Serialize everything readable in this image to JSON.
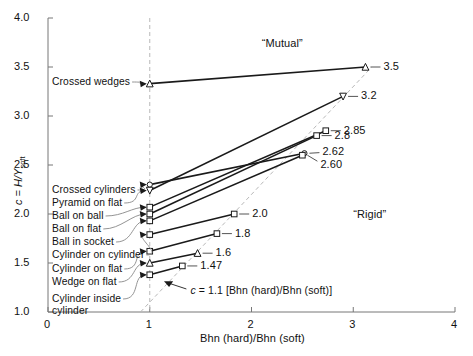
{
  "chart_data": {
    "type": "line",
    "title": "",
    "xlabel": "Bhn (hard)/Bhn (soft)",
    "ylabel": "c = H/Y soft",
    "ylabel_parts": {
      "c": "c",
      "eq": " = ",
      "H": "H",
      "slash": "/",
      "Y": "Y",
      "sub": "soft"
    },
    "xlim": [
      0,
      4
    ],
    "ylim": [
      1.0,
      4.0
    ],
    "xticks": [
      0,
      1,
      2,
      3,
      4
    ],
    "xticklabels": [
      "0",
      "1",
      "2",
      "3",
      "4"
    ],
    "yticks": [
      1.0,
      1.5,
      2.0,
      2.5,
      3.0,
      3.5,
      4.0
    ],
    "yticklabels": [
      "1.0",
      "1.5",
      "2.0",
      "2.5",
      "3.0",
      "3.5",
      "4.0"
    ],
    "grid": false,
    "legend_position": "inline-labels",
    "reference_lines": [
      {
        "name": "vertical-unity-line",
        "type": "vertical-dashed",
        "x": 1
      },
      {
        "name": "rigid-mutual-boundary",
        "type": "diagonal-dashed",
        "equation": "c = 1.1[Bhn(hard)/Bhn(soft)]",
        "slope": 1.1,
        "intercept": 0,
        "x_from": 0.91,
        "x_to": 3.18
      }
    ],
    "annotations": [
      {
        "name": "mutual-region-label",
        "text": "“Mutual”",
        "x": 2.1,
        "y": 3.73
      },
      {
        "name": "rigid-region-label",
        "text": "“Rigid”",
        "x": 3.0,
        "y": 1.99
      },
      {
        "name": "equation-label",
        "text": "c = 1.1[Bhn (hard)/Bhn (soft)]",
        "x": 1.4,
        "y": 1.21
      }
    ],
    "series": [
      {
        "name": "Crossed wedges",
        "label": "Crossed wedges",
        "marker": "triangle",
        "x": [
          1,
          3.12
        ],
        "y": [
          3.33,
          3.5
        ],
        "end_value": "3.5",
        "end_label": "3.5"
      },
      {
        "name": "Crossed cylinders",
        "label": "Crossed cylinders",
        "marker": "circle",
        "x": [
          1,
          2.52
        ],
        "y": [
          2.3,
          2.62
        ],
        "end_value": "2.62",
        "end_label": "2.62"
      },
      {
        "name": "Pyramid on flat",
        "label": "Pyramid on flat",
        "marker": "triangle-down",
        "x": [
          1,
          2.9
        ],
        "y": [
          2.24,
          3.2
        ],
        "end_value": "3.2",
        "end_label": "3.2"
      },
      {
        "name": "Ball on ball",
        "label": "Ball on ball",
        "marker": "square",
        "x": [
          1,
          2.73
        ],
        "y": [
          2.07,
          2.85
        ],
        "end_value": "2.85",
        "end_label": "2.85"
      },
      {
        "name": "Ball on flat",
        "label": "Ball on flat",
        "marker": "square",
        "x": [
          1,
          2.64
        ],
        "y": [
          2.0,
          2.8
        ],
        "end_value": "2.8",
        "end_label": "2.8"
      },
      {
        "name": "Ball in socket",
        "label": "Ball in socket",
        "marker": "square",
        "x": [
          1,
          2.5
        ],
        "y": [
          1.93,
          2.6
        ],
        "end_value": "2.60",
        "end_label": "2.60"
      },
      {
        "name": "Cylinder on cylinder",
        "label": "Cylinder on cylinder",
        "marker": "square",
        "x": [
          1,
          1.83
        ],
        "y": [
          1.79,
          2.0
        ],
        "end_value": "2.0",
        "end_label": "2.0"
      },
      {
        "name": "Cylinder on flat",
        "label": "Cylinder on flat",
        "marker": "square",
        "x": [
          1,
          1.66
        ],
        "y": [
          1.62,
          1.8
        ],
        "end_value": "1.8",
        "end_label": "1.8"
      },
      {
        "name": "Wedge on flat",
        "label": "Wedge on flat",
        "marker": "triangle",
        "x": [
          1,
          1.47
        ],
        "y": [
          1.5,
          1.6
        ],
        "end_value": "1.6",
        "end_label": "1.6"
      },
      {
        "name": "Cylinder inside cylinder",
        "label": "Cylinder inside cylinder",
        "marker": "square",
        "x": [
          1,
          1.32
        ],
        "y": [
          1.38,
          1.47
        ],
        "end_value": "1.47",
        "end_label": "1.47"
      }
    ],
    "left_labels": [
      "Crossed wedges",
      "Crossed cylinders",
      "Pyramid on flat",
      "Ball on ball",
      "Ball on flat",
      "Ball in socket",
      "Cylinder on cylinder",
      "Cylinder on flat",
      "Wedge on flat",
      "Cylinder inside",
      "cylinder"
    ],
    "value_labels": [
      "3.5",
      "3.2",
      "2.85",
      "2.8",
      "2.62",
      "2.60",
      "2.0",
      "1.8",
      "1.6",
      "1.47"
    ],
    "colors": {
      "line": "#1a1a1a",
      "dashed": "#b8b8b8",
      "axis": "#777777",
      "text": "#111111"
    }
  }
}
